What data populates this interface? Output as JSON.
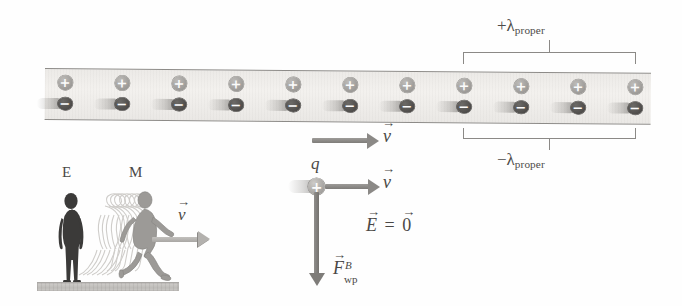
{
  "figure": {
    "kind": "physics-diagram",
    "title_visible": false
  },
  "wire": {
    "name": "current-carrying-wire",
    "charge_pairs": 11,
    "positive_symbol": "+",
    "negative_symbol": "−",
    "pair_x": [
      65,
      122,
      179,
      236,
      293,
      350,
      407,
      464,
      521,
      578,
      635
    ],
    "drifting_charge": "negative"
  },
  "brackets": {
    "upper": {
      "label_sign": "+",
      "label_symbol": "λ",
      "label_subscript": "proper",
      "left_x": 463,
      "right_x": 636
    },
    "lower": {
      "label_sign": "−",
      "label_symbol": "λ",
      "label_subscript": "proper",
      "left_x": 463,
      "right_x": 636
    }
  },
  "wire_velocity_vector": {
    "name": "wire-frame-velocity",
    "symbol": "v",
    "accent": "→"
  },
  "test_charge": {
    "name": "test-charge",
    "label": "q",
    "sign": "+",
    "velocity_symbol": "v",
    "velocity_accent": "→"
  },
  "field_statement": {
    "e_symbol": "E",
    "equals": "=",
    "zero_symbol": "0",
    "accent": "→",
    "text_plain": "E⃗ = 0⃗"
  },
  "force_label": {
    "name": "magnetic-force-on-test-charge",
    "symbol": "F",
    "accent": "→",
    "superscript": "B",
    "subscript": "wp",
    "text_plain": "F⃗ B wp"
  },
  "observers": {
    "stationary": {
      "label": "E",
      "name": "observer-E-stationary"
    },
    "moving": {
      "label": "M",
      "name": "observer-M-moving"
    },
    "velocity_vector": {
      "symbol": "v",
      "accent": "→"
    }
  },
  "colors": {
    "strip_fill": "#ecebe8",
    "strip_border": "#8d8b88",
    "positive_charge": "#9c9a97",
    "negative_charge": "#4e4c4a",
    "arrow": "#8b8986",
    "text": "#4a4846",
    "figure_dark": "#3b3a39",
    "figure_gray": "#9a9895",
    "ground": "#c4c2bf",
    "background": "#ffffff"
  }
}
